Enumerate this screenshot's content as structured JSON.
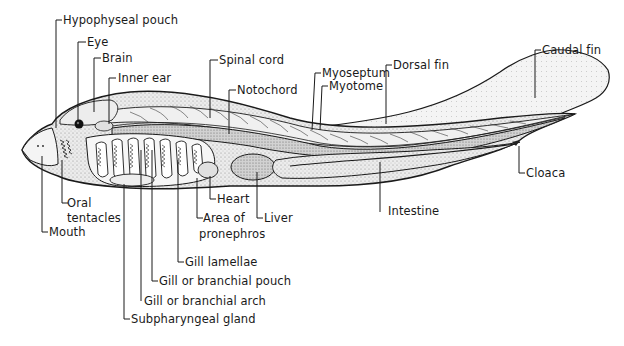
{
  "diagram": {
    "labels": {
      "hypophyseal_pouch": "Hypophyseal pouch",
      "eye": "Eye",
      "brain": "Brain",
      "inner_ear": "Inner ear",
      "spinal_cord": "Spinal cord",
      "notochord": "Notochord",
      "myoseptum": "Myoseptum",
      "myotome": "Myotome",
      "dorsal_fin": "Dorsal fin",
      "caudal_fin": "Caudal fin",
      "cloaca": "Cloaca",
      "intestine": "Intestine",
      "liver": "Liver",
      "heart": "Heart",
      "area_of_pronephros_1": "Area of",
      "area_of_pronephros_2": "pronephros",
      "gill_lamellae": "Gill lamellae",
      "gill_pouch": "Gill or branchial pouch",
      "gill_arch": "Gill or branchial arch",
      "subpharyngeal_gland": "Subpharyngeal gland",
      "oral_tentacles_1": "Oral",
      "oral_tentacles_2": "tentacles",
      "mouth": "Mouth"
    },
    "colors": {
      "ink": "#1a1a1a",
      "body_fill": "#e6e6e6",
      "fin_fill": "#f1f1f1",
      "dark_fill": "#bdbdbd",
      "background": "#ffffff"
    }
  }
}
